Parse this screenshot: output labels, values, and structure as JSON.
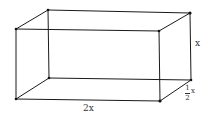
{
  "diagram": {
    "type": "rectangular-box-3d",
    "stroke_color": "#1a1a1a",
    "vertices": {
      "front_top_left": [
        16,
        29
      ],
      "front_top_right": [
        159,
        31
      ],
      "front_bottom_right": [
        160,
        101
      ],
      "front_bottom_left": [
        16,
        99
      ],
      "back_top_left": [
        48,
        10
      ],
      "back_top_right": [
        190,
        13
      ],
      "back_bottom_right": [
        191,
        80
      ],
      "back_bottom_left": [
        49,
        78
      ]
    },
    "labels": {
      "length": "2x",
      "height": "x",
      "depth_numerator": "1",
      "depth_denominator": "2",
      "depth_variable": "x"
    }
  }
}
